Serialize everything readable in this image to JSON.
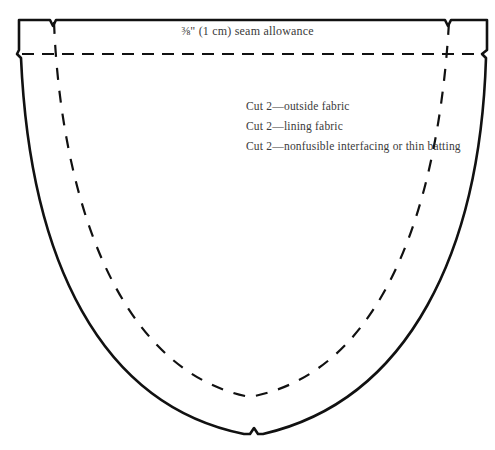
{
  "diagram": {
    "type": "sewing-pattern-piece",
    "seam_label": "⅜\" (1 cm) seam allowance",
    "instructions": [
      "Cut 2—outside fabric",
      "Cut 2—lining fabric",
      "Cut 2—nonfusible interfacing or thin batting"
    ],
    "colors": {
      "line": "#111111",
      "text": "#3a3a3a",
      "background": "#ffffff"
    }
  }
}
